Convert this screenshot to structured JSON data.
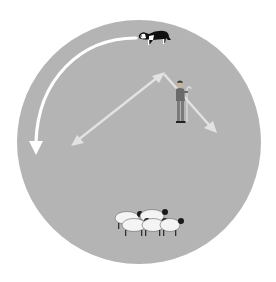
{
  "diagram": {
    "colors": {
      "background": "#ffffff",
      "field": "#b4b4b4",
      "outrun_arrow": "#ffffff",
      "handler_arrows": "#e2e2e2",
      "dog_body": "#111111",
      "sheep_body": "#f4f4f4",
      "sheep_head": "#1a1a1a"
    },
    "elements": {
      "field": {
        "shape": "circle",
        "cx": 139,
        "cy": 142,
        "r": 122
      },
      "dog": {
        "label": "sheepdog",
        "x": 148,
        "y": 38
      },
      "handler": {
        "label": "shepherd with crook",
        "x": 181,
        "y": 100
      },
      "flock": {
        "label": "sheep",
        "count": 5,
        "x": 148,
        "y": 222
      },
      "arrows": [
        {
          "name": "outrun",
          "from": "dog",
          "direction": "counter-clockwise to left"
        },
        {
          "name": "diagonal-double",
          "from": [
            73,
            144
          ],
          "to": [
            163,
            73
          ],
          "heads": 2
        },
        {
          "name": "diagonal-down",
          "from": [
            163,
            73
          ],
          "to": [
            216,
            132
          ],
          "heads": 1
        }
      ]
    }
  }
}
